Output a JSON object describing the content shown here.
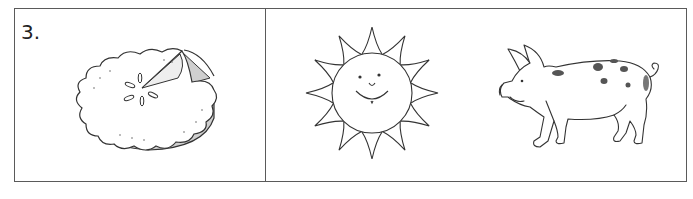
{
  "exercise": {
    "number_label": "3.",
    "left_panel": {
      "pictures": [
        {
          "name": "pie",
          "icon": "pie-icon"
        }
      ]
    },
    "right_panel": {
      "pictures": [
        {
          "name": "sun",
          "icon": "sun-icon"
        },
        {
          "name": "pig",
          "icon": "pig-icon"
        }
      ]
    }
  },
  "colors": {
    "border": "#5a5a5a",
    "line": "#333333",
    "pie_dish": "#cfcfcf",
    "pig_spots": "#555555"
  }
}
